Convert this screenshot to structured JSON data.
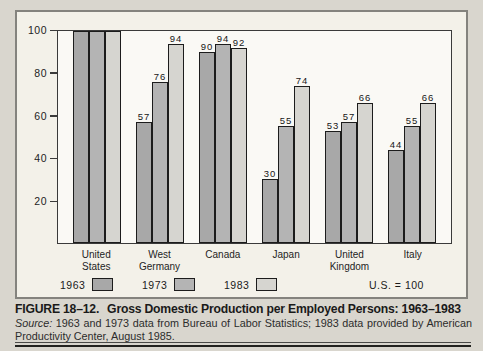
{
  "figure": {
    "caption_label": "FIGURE 18–12.",
    "caption_title": "Gross Domestic Production per Employed Persons: 1963–1983",
    "source_prefix": "Source:",
    "source_text": "1963 and 1973 data from Bureau of Labor Statistics; 1983 data provided by American Productivity Center, August 1985.",
    "note": "U.S. = 100"
  },
  "colors": {
    "series": [
      "#a8a8a8",
      "#b4b4b4",
      "#d6d5d0"
    ],
    "bar_border": "#1c1c1c",
    "page_background": "#d9d6ce",
    "box_background": "#f3f1e9"
  },
  "chart_data": {
    "type": "bar",
    "title": "Gross Domestic Production per Employed Persons: 1963–1983",
    "categories": [
      "United States",
      "West Germany",
      "Canada",
      "Japan",
      "United Kingdom",
      "Italy"
    ],
    "categories_lines": [
      [
        "United",
        "States"
      ],
      [
        "West",
        "Germany"
      ],
      [
        "Canada"
      ],
      [
        "Japan"
      ],
      [
        "United",
        "Kingdom"
      ],
      [
        "Italy"
      ]
    ],
    "series": [
      {
        "name": "1963",
        "values": [
          100,
          57,
          90,
          30,
          53,
          44
        ]
      },
      {
        "name": "1973",
        "values": [
          100,
          76,
          94,
          55,
          57,
          55
        ]
      },
      {
        "name": "1983",
        "values": [
          100,
          94,
          92,
          74,
          66,
          66
        ]
      }
    ],
    "ylim": [
      0,
      100
    ],
    "yticks": [
      20,
      40,
      60,
      80,
      100
    ],
    "value_labels_shown": true,
    "value_labels_hidden_at_max": true,
    "legend_position": "bottom",
    "annotation": "U.S. = 100",
    "grid": false
  }
}
